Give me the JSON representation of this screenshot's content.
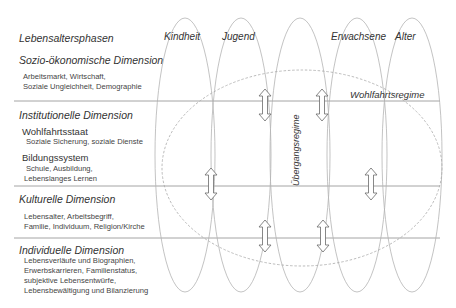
{
  "header": {
    "row_label": "Lebensaltersphasen",
    "phases": [
      "Kindheit",
      "Jugend",
      "Erwachsene",
      "Alter"
    ]
  },
  "dimensions": [
    {
      "title": "Sozio-ökonomische Dimension",
      "items": [
        "Arbeitsmarkt, Wirtschaft,",
        "Soziale Ungleichheit, Demographie"
      ]
    },
    {
      "title": "Institutionelle Dimension",
      "groups": [
        {
          "title": "Wohlfahrtsstaat",
          "items": [
            "Soziale Sicherung, soziale Dienste"
          ]
        },
        {
          "title": "Bildungssystem",
          "items": [
            "Schule, Ausbildung,",
            "Lebenslanges Lernen"
          ]
        }
      ]
    },
    {
      "title": "Kulturelle Dimension",
      "items": [
        "Lebensalter, Arbeitsbegriff,",
        "Familie, Individuum, Religion/Kirche"
      ]
    },
    {
      "title": "Individuelle Dimension",
      "items": [
        "Lebensverläufe und Biographien,",
        "Erwerbskarrieren, Familienstatus,",
        "subjektive Lebensentwürfe,",
        "Lebensbewältigung und Bilanzierung"
      ]
    }
  ],
  "regimes": {
    "welfare": "Wohlfahrtsregime",
    "transition": "Übergangsregime"
  },
  "colors": {
    "line": "#8a8a8a",
    "ellipse": "#b0b0b0",
    "dashed": "#a8a8a8",
    "arrow": "#6a6a6a"
  }
}
